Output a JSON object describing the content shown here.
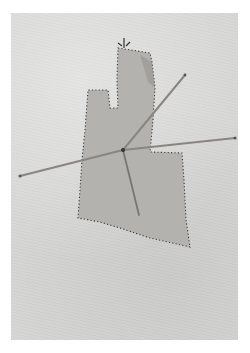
{
  "artwork": {
    "description": "Photograph of an abstract artwork: a gray stitched fabric cut-out shape with dotted outline, mounted on a pale textured canvas, pierced by four thin rods radiating from a central point.",
    "colors": {
      "background": "#ffffff",
      "canvas": "#d6d6d4",
      "fabric": "#b3b1ad",
      "stitch": "#3a3a3a",
      "rod": "#8a8580"
    },
    "rods": [
      {
        "name": "left-rod",
        "from": [
          20,
          176
        ],
        "to": [
          123,
          150
        ]
      },
      {
        "name": "right-rod",
        "from": [
          123,
          150
        ],
        "to": [
          235,
          138
        ]
      },
      {
        "name": "diagonal-rod",
        "from": [
          123,
          150
        ],
        "to": [
          185,
          75
        ]
      },
      {
        "name": "lower-rod",
        "from": [
          123,
          150
        ],
        "to": [
          139,
          215
        ]
      }
    ]
  }
}
